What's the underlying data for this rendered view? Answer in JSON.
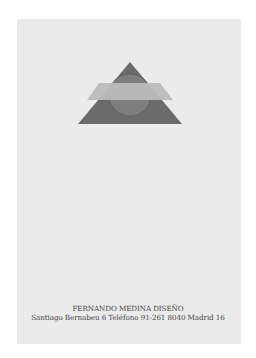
{
  "logo": {
    "name": "triangle-circle-rectangle-emblem",
    "colors": {
      "triangle": "#6a6a6a",
      "circle": "#7d7d7d",
      "band": "#b9b9b9",
      "paper": "#ebebeb"
    }
  },
  "caption": {
    "line1": "FERNANDO MEDINA  DISEÑO",
    "line2": "Santiago Bernabeu 6  Teléfono 91-261 8040 Madrid 16"
  }
}
